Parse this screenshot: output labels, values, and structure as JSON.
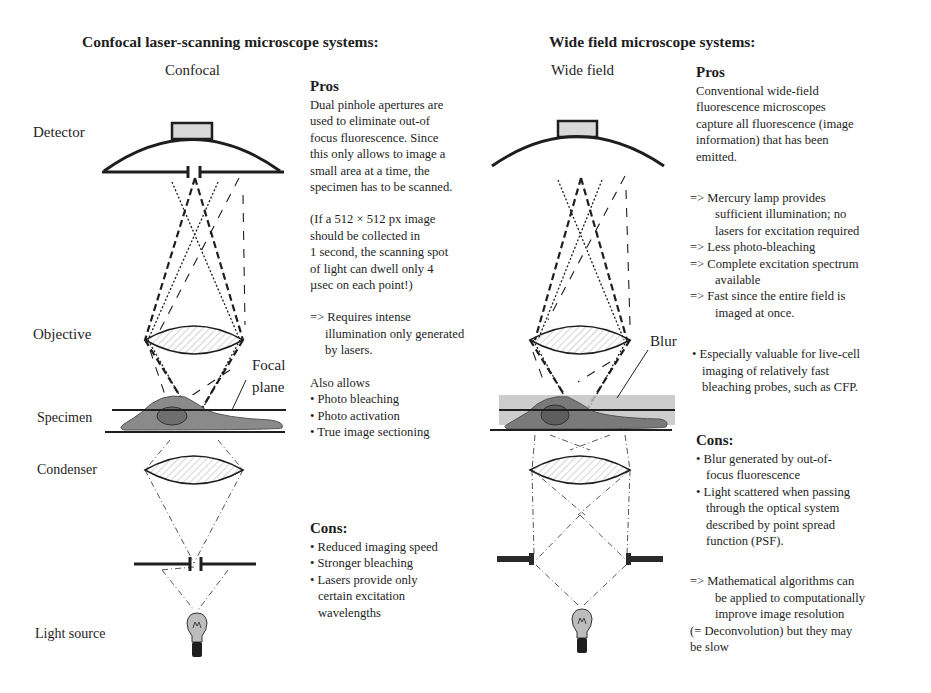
{
  "confocal": {
    "heading": "Confocal laser-scanning microscope systems:",
    "diagram_title": "Confocal",
    "labels": {
      "detector": "Detector",
      "objective": "Objective",
      "focal_plane_1": "Focal",
      "focal_plane_2": "plane",
      "specimen": "Specimen",
      "condenser": "Condenser",
      "light_source": "Light source"
    },
    "pros": {
      "title": "Pros",
      "paragraph_lines": [
        "Dual pinhole apertures are",
        "used to eliminate out-of",
        "focus fluorescence. Since",
        "this only allows to image a",
        "small area at a time, the",
        "specimen has to be scanned."
      ],
      "example_lines": [
        "(If a 512 × 512 px image",
        "should be collected in",
        "1 second, the scanning spot",
        "of light can dwell only 4",
        "µsec on each point!)"
      ],
      "implication_lines": [
        "=> Requires intense",
        "illumination only generated",
        "by lasers."
      ],
      "also_allows_label": "Also allows",
      "also_allows": [
        "• Photo bleaching",
        "• Photo activation",
        "• True image sectioning"
      ]
    },
    "cons": {
      "title": "Cons:",
      "items": [
        "• Reduced imaging speed",
        "• Stronger bleaching",
        "• Lasers provide only",
        "certain excitation",
        "wavelengths"
      ]
    }
  },
  "widefield": {
    "heading": "Wide field microscope systems:",
    "diagram_title": "Wide field",
    "labels": {
      "blur": "Blur"
    },
    "pros": {
      "title": "Pros",
      "paragraph_lines": [
        "Conventional wide-field",
        "fluorescence microscopes",
        "capture all fluorescence (image",
        "information) that has been",
        "emitted."
      ],
      "arrow_items": [
        [
          "=> Mercury lamp provides",
          "sufficient illumination; no",
          "lasers for excitation required"
        ],
        [
          "=> Less photo-bleaching"
        ],
        [
          "=> Complete excitation spectrum",
          "available"
        ],
        [
          "=> Fast since the entire field is",
          "imaged at once."
        ]
      ],
      "bullet_lines": [
        "• Especially valuable for live-cell",
        "imaging of relatively fast",
        "bleaching probes, such as CFP."
      ]
    },
    "cons": {
      "title": "Cons:",
      "items": [
        "• Blur generated by out-of-",
        "focus fluorescence",
        "• Light scattered when passing",
        "through the optical system",
        "described by point spread",
        "function (PSF)."
      ],
      "conclusion_lines": [
        "=> Mathematical algorithms can",
        "be applied to computationally",
        "improve image resolution",
        "(= Deconvolution) but they may",
        "be slow"
      ]
    }
  },
  "colors": {
    "ink": "#1e1e1e",
    "cell_fill": "#8a8a8a",
    "nucleus_fill": "#6e6e6e",
    "blur_band": "#c4c4c4",
    "detector_fill": "#d8d8d8"
  }
}
